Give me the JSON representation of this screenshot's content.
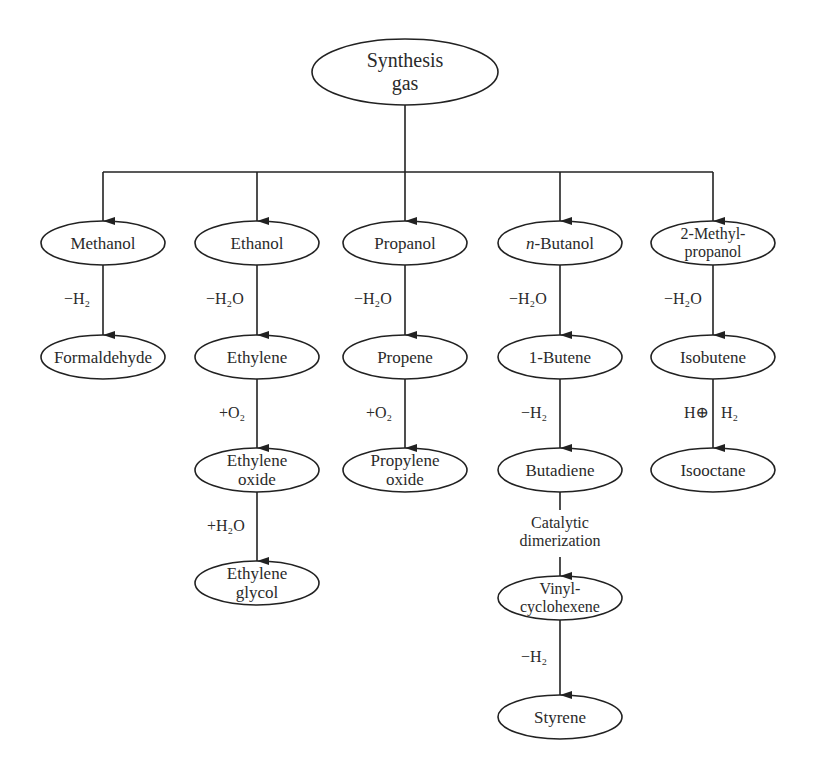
{
  "title": "Synthesis gas",
  "root": {
    "label": "Synthesis\ngas"
  },
  "columns": [
    {
      "alcohol": "Methanol",
      "steps": [
        {
          "reagent": "−H₂",
          "product": "Formaldehyde"
        }
      ]
    },
    {
      "alcohol": "Ethanol",
      "steps": [
        {
          "reagent": "−H₂O",
          "product": "Ethylene"
        },
        {
          "reagent": "+O₂",
          "product": "Ethylene\noxide"
        },
        {
          "reagent": "+H₂O",
          "product": "Ethylene\nglycol"
        }
      ]
    },
    {
      "alcohol": "Propanol",
      "steps": [
        {
          "reagent": "−H₂O",
          "product": "Propene"
        },
        {
          "reagent": "+O₂",
          "product": "Propylene\noxide"
        }
      ]
    },
    {
      "alcohol_prefix": "n",
      "alcohol_suffix": "-Butanol",
      "alcohol": "n-Butanol",
      "steps": [
        {
          "reagent": "−H₂O",
          "product": "1-Butene"
        },
        {
          "reagent": "−H₂",
          "product": "Butadiene"
        },
        {
          "reagent": "Catalytic\ndimerization",
          "product": "Vinyl-\ncyclohexene"
        },
        {
          "reagent": "−H₂",
          "product": "Styrene"
        }
      ]
    },
    {
      "alcohol": "2-Methyl-\npropanol",
      "steps": [
        {
          "reagent": "−H₂O",
          "product": "Isobutene"
        },
        {
          "reagent_left": "H⊕",
          "reagent_right": "H₂",
          "product": "Isooctane"
        }
      ]
    }
  ],
  "colors": {
    "line": "#222222",
    "text": "#2a2a2a",
    "background": "#ffffff"
  }
}
